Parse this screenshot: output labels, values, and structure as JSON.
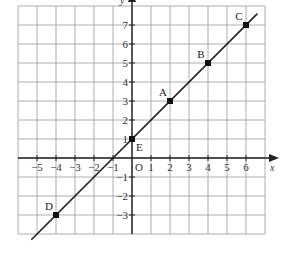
{
  "chart_data": {
    "type": "line",
    "title": "",
    "xlabel": "x",
    "ylabel": "y",
    "origin_label": "O",
    "xlim": [
      -6,
      7
    ],
    "ylim": [
      -4,
      8
    ],
    "grid": true,
    "x_ticks": [
      -5,
      -4,
      -3,
      -2,
      -1,
      1,
      2,
      3,
      4,
      5,
      6
    ],
    "y_ticks": [
      -3,
      -2,
      -1,
      1,
      2,
      3,
      4,
      5,
      6,
      7
    ],
    "x_tick_labels": [
      "−5",
      "−4",
      "−3",
      "−2",
      "−1",
      "1",
      "2",
      "3",
      "4",
      "5",
      "6"
    ],
    "y_tick_labels": [
      "−3",
      "−2",
      "−1",
      "1",
      "2",
      "3",
      "4",
      "5",
      "6",
      "7"
    ],
    "series": [
      {
        "name": "y = x + 1",
        "line_from": [
          -5.3,
          -4.3
        ],
        "line_to": [
          6.6,
          7.6
        ],
        "points": [
          {
            "label": "D",
            "x": -4,
            "y": -3
          },
          {
            "label": "E",
            "x": 0,
            "y": 1
          },
          {
            "label": "A",
            "x": 2,
            "y": 3
          },
          {
            "label": "B",
            "x": 4,
            "y": 5
          },
          {
            "label": "C",
            "x": 6,
            "y": 7
          }
        ]
      }
    ],
    "colors": {
      "grid": "#9a9a9a",
      "axis": "#222222",
      "line": "#222222",
      "point": "#111111"
    }
  }
}
